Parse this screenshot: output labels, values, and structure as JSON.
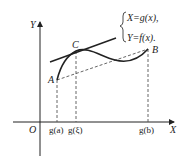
{
  "diagram": {
    "axes": {
      "x_label": "X",
      "y_label": "Y",
      "origin_label": "O"
    },
    "points": {
      "A": "A",
      "B": "B",
      "C": "C"
    },
    "x_ticks": [
      "g(a)",
      "g(ξ)",
      "g(b)"
    ],
    "equations": {
      "line1": "X=g(x),",
      "line2": "Y=f(x)."
    },
    "colors": {
      "stroke": "#222222",
      "dashed": "#555555",
      "background": "#ffffff"
    }
  }
}
